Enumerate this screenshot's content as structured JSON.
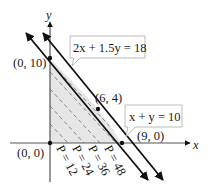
{
  "figure": {
    "axes": {
      "x_label": "x",
      "y_label": "y"
    },
    "lines": [
      {
        "equation": "2x + 1.5y = 18",
        "label": "2x + 1.5y = 18"
      },
      {
        "equation": "x + y = 10",
        "label": "x + y = 10"
      }
    ],
    "vertices": [
      {
        "label": "(0, 10)"
      },
      {
        "label": "(6, 4)"
      },
      {
        "label": "(9, 0)"
      },
      {
        "label": "(0, 0)"
      }
    ],
    "objective_lines": [
      {
        "label": "P = 12"
      },
      {
        "label": "P = 24"
      },
      {
        "label": "P = 36"
      },
      {
        "label": "P = 48"
      }
    ],
    "colors": {
      "region_fill": "#e6e6e6",
      "line": "#111111",
      "dash": "#777777"
    }
  }
}
